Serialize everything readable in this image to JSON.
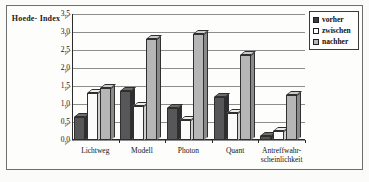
{
  "chart_data": {
    "type": "bar",
    "title": "",
    "ylabel": "Hoede-Index",
    "xlabel": "",
    "ylim": [
      0.0,
      3.5
    ],
    "yticks": [
      "0,0",
      "0,5",
      "1,0",
      "1,5",
      "2,0",
      "2,5",
      "3,0",
      "3,5"
    ],
    "ytick_values": [
      0.0,
      0.5,
      1.0,
      1.5,
      2.0,
      2.5,
      3.0,
      3.5
    ],
    "grid": true,
    "legend_position": "top-right",
    "categories": [
      "Lichtweg",
      "Modell",
      "Photon",
      "Quant",
      "Antreffwahr-\nscheinlichkeit"
    ],
    "series": [
      {
        "name": "vorher",
        "color": "#57575a",
        "values": [
          0.65,
          1.35,
          0.9,
          1.2,
          0.1
        ]
      },
      {
        "name": "zwischen",
        "color": "#fbfbfb",
        "values": [
          1.3,
          0.95,
          0.55,
          0.75,
          0.25
        ]
      },
      {
        "name": "nachher",
        "color": "#b6b6b6",
        "values": [
          1.45,
          2.8,
          2.95,
          2.35,
          1.25
        ]
      }
    ]
  },
  "legend": {
    "items": [
      {
        "label": "vorher"
      },
      {
        "label": "zwischen"
      },
      {
        "label": "nachher"
      }
    ]
  },
  "axis": {
    "y_title": "Hoede-\nIndex"
  }
}
